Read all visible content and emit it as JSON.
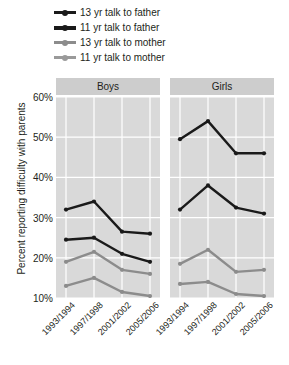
{
  "chart_data": {
    "type": "line",
    "title": "",
    "xlabel": "",
    "ylabel": "Percent reporting difficulty with parents",
    "ylim": [
      10,
      60
    ],
    "yticks": [
      "10%",
      "20%",
      "30%",
      "40%",
      "50%",
      "60%"
    ],
    "ytick_values": [
      10,
      20,
      30,
      40,
      50,
      60
    ],
    "grid": true,
    "legend_position": "top-left",
    "categories": [
      "1993/1994",
      "1997/1998",
      "2001/2002",
      "2005/2006"
    ],
    "panels": [
      {
        "name": "Boys",
        "series": [
          {
            "name": "13 yr talk to father",
            "color": "#1a1a1a",
            "values": [
              32,
              34,
              26.5,
              26
            ]
          },
          {
            "name": "11 yr talk to father",
            "color": "#1a1a1a",
            "values": [
              24.5,
              25,
              21,
              19
            ]
          },
          {
            "name": "13 yr talk to mother",
            "color": "#8c8c8c",
            "values": [
              19,
              21.5,
              17,
              16
            ]
          },
          {
            "name": "11 yr talk to mother",
            "color": "#8c8c8c",
            "values": [
              13,
              15,
              11.5,
              10.5
            ]
          }
        ]
      },
      {
        "name": "Girls",
        "series": [
          {
            "name": "13 yr talk to father",
            "color": "#1a1a1a",
            "values": [
              49.5,
              54,
              46,
              46
            ]
          },
          {
            "name": "11 yr talk to father",
            "color": "#1a1a1a",
            "values": [
              32,
              38,
              32.5,
              31
            ]
          },
          {
            "name": "13 yr talk to mother",
            "color": "#8c8c8c",
            "values": [
              18.5,
              22,
              16.5,
              17
            ]
          },
          {
            "name": "11 yr talk to mother",
            "color": "#8c8c8c",
            "values": [
              13.5,
              14,
              11,
              10.5
            ]
          }
        ]
      }
    ],
    "legend": [
      {
        "label": "13 yr talk to father",
        "color": "#1a1a1a",
        "width": 3
      },
      {
        "label": "11 yr talk to father",
        "color": "#1a1a1a",
        "width": 4
      },
      {
        "label": "13 yr talk to mother",
        "color": "#8c8c8c",
        "width": 3
      },
      {
        "label": "11 yr talk to mother",
        "color": "#9a9a9a",
        "width": 3
      }
    ]
  },
  "colors": {
    "panel_background": "#d9d9d9",
    "strip_background": "#cdcdcd",
    "gridline": "#ffffff",
    "dark_series": "#1a1a1a",
    "gray_series": "#8c8c8c",
    "text": "#231f20"
  }
}
